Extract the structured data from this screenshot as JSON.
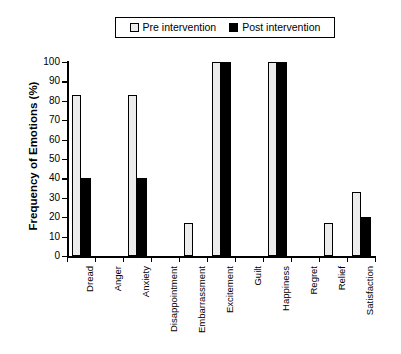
{
  "chart_data": {
    "type": "bar",
    "title": "",
    "xlabel": "",
    "ylabel": "Frequency of Emotions (%)",
    "ylim": [
      0,
      100
    ],
    "yticks": [
      0,
      10,
      20,
      30,
      40,
      50,
      60,
      70,
      80,
      90,
      100
    ],
    "grid": false,
    "legend_position": "top-center",
    "categories": [
      "Dread",
      "Anger",
      "Anxiety",
      "Disappointment",
      "Embarrassment",
      "Excitement",
      "Guilt",
      "Happiness",
      "Regret",
      "Relief",
      "Satisfaction"
    ],
    "series": [
      {
        "name": "Pre intervention",
        "color": "#ececec",
        "values": [
          83,
          0,
          83,
          0,
          17,
          100,
          0,
          100,
          0,
          17,
          33
        ]
      },
      {
        "name": "Post intervention",
        "color": "#000000",
        "values": [
          40,
          0,
          40,
          0,
          0,
          100,
          0,
          100,
          0,
          0,
          20
        ]
      }
    ]
  },
  "legend": {
    "entries": [
      {
        "label": "Pre intervention",
        "swatch": "pre"
      },
      {
        "label": "Post intervention",
        "swatch": "post"
      }
    ]
  }
}
